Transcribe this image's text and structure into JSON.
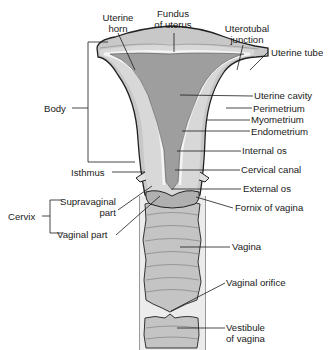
{
  "diagram": {
    "colors": {
      "perimetrium": "#c8c8c8",
      "myometrium": "#d6d6d6",
      "endometrium_line": "#f2f2f2",
      "uterine_cavity": "#9e9e9e",
      "vagina": "#c4c4c4",
      "outline": "#222222",
      "label_text": "#1a1a1a"
    },
    "labels": {
      "uterine_horn": [
        "Uterine",
        "horn"
      ],
      "fundus": [
        "Fundus",
        "of uterus"
      ],
      "uterotubal_junction": [
        "Uterotubal",
        "junction"
      ],
      "uterine_tube": "Uterine tube",
      "uterine_cavity": "Uterine cavity",
      "perimetrium": "Perimetrium",
      "myometrium": "Myometrium",
      "endometrium": "Endometrium",
      "internal_os": "Internal os",
      "cervical_canal": "Cervical canal",
      "external_os": "External os",
      "fornix": "Fornix of vagina",
      "vagina": "Vagina",
      "vaginal_orifice": "Vaginal orifice",
      "vestibule": [
        "Vestibule",
        "of vagina"
      ],
      "body": "Body",
      "isthmus": "Isthmus",
      "cervix": "Cervix",
      "supravaginal_part": [
        "Supravaginal",
        "part"
      ],
      "vaginal_part": "Vaginal part"
    }
  }
}
